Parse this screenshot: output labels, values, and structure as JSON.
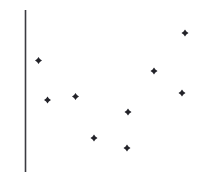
{
  "chart_data": {
    "type": "scatter",
    "title": "",
    "subtitle": "",
    "xlabel": "",
    "ylabel": "",
    "xlim": [
      0,
      206
    ],
    "ylim": [
      0,
      175
    ],
    "grid": false,
    "legend": null,
    "legend_position": "none",
    "annotations": [],
    "xtick_labels": [],
    "ytick_labels": [],
    "axis": {
      "vertical_axis_visible": true,
      "horizontal_axis_visible": false,
      "vertical_axis_x": 25.5,
      "vertical_axis_y_top": 10,
      "vertical_axis_y_bottom": 172,
      "color": "#3b3b41",
      "width": 1.6
    },
    "marker": {
      "shape": "diamond-plus",
      "size": 7,
      "color": "#232329"
    },
    "point_count": 9,
    "x": [
      38.5,
      47.5,
      75.5,
      94,
      127,
      128,
      154,
      182,
      185
    ],
    "y": [
      60.5,
      100,
      96.5,
      138,
      148,
      112,
      71,
      93,
      33
    ],
    "points": [
      {
        "label": "p1",
        "x": 38.5,
        "y": 60.5
      },
      {
        "label": "p2",
        "x": 47.5,
        "y": 100
      },
      {
        "label": "p3",
        "x": 75.5,
        "y": 96.5
      },
      {
        "label": "p4",
        "x": 94,
        "y": 138
      },
      {
        "label": "p5",
        "x": 127,
        "y": 148
      },
      {
        "label": "p6",
        "x": 128,
        "y": 112
      },
      {
        "label": "p7",
        "x": 154,
        "y": 71
      },
      {
        "label": "p8",
        "x": 182,
        "y": 93
      },
      {
        "label": "p9",
        "x": 185,
        "y": 33
      }
    ]
  },
  "colors": {
    "background": "#ffffff",
    "marker": "#232329",
    "axis": "#3b3b41"
  }
}
